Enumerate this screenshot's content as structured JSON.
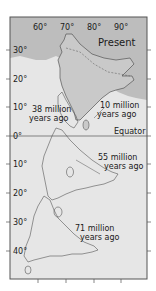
{
  "map": {
    "title": "Present",
    "colors": {
      "ocean": "#e6e6e6",
      "asia": "#bdbdbd",
      "india_present": "#c9c9c9",
      "coast": "#555555",
      "frame": "#555555",
      "text": "#1a1a1a"
    },
    "longitude_ticks": [
      "60°",
      "70°",
      "80°",
      "90°"
    ],
    "latitude_ticks": [
      "30°",
      "20°",
      "10°",
      "0°",
      "10°",
      "20°",
      "30°",
      "40°"
    ],
    "equator_label": "Equator",
    "positions": [
      {
        "line1": "10 million",
        "line2": "years ago"
      },
      {
        "line1": "38 million",
        "line2": "years ago"
      },
      {
        "line1": "55 million",
        "line2": "years ago"
      },
      {
        "line1": "71 million",
        "line2": "years ago"
      }
    ]
  }
}
